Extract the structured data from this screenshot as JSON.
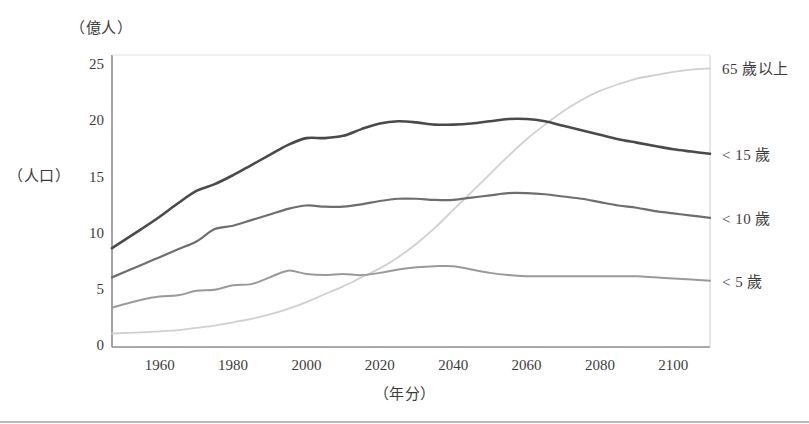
{
  "chart_data": {
    "type": "line",
    "title": "",
    "xlabel": "（年分）",
    "ylabel": "（人口）",
    "y_unit": "（億人）",
    "xlim": [
      1947,
      2110
    ],
    "ylim": [
      0,
      26
    ],
    "yticks": [
      0,
      5,
      10,
      15,
      20,
      25
    ],
    "xticks": [
      1960,
      1980,
      2000,
      2020,
      2040,
      2060,
      2080,
      2100
    ],
    "grid": false,
    "legend_position": "right-of-plot",
    "series": [
      {
        "name": "65 歲以上",
        "color": "#d0d0d0",
        "x": [
          1947,
          1955,
          1960,
          1965,
          1970,
          1975,
          1980,
          1985,
          1990,
          1995,
          2000,
          2005,
          2010,
          2015,
          2020,
          2025,
          2030,
          2035,
          2040,
          2045,
          2050,
          2055,
          2060,
          2065,
          2070,
          2075,
          2080,
          2085,
          2090,
          2095,
          2100,
          2105,
          2110
        ],
        "values": [
          1.2,
          1.3,
          1.4,
          1.5,
          1.7,
          1.9,
          2.2,
          2.5,
          2.9,
          3.4,
          4.0,
          4.7,
          5.4,
          6.2,
          7.0,
          8.0,
          9.2,
          10.6,
          12.2,
          13.8,
          15.4,
          17.0,
          18.5,
          19.8,
          21.0,
          22.0,
          22.8,
          23.4,
          23.9,
          24.2,
          24.5,
          24.7,
          24.8
        ]
      },
      {
        "name": "< 15 歲",
        "color": "#4a4a4a",
        "x": [
          1947,
          1955,
          1960,
          1965,
          1970,
          1975,
          1980,
          1985,
          1990,
          1995,
          2000,
          2005,
          2010,
          2015,
          2020,
          2025,
          2030,
          2035,
          2040,
          2045,
          2050,
          2055,
          2060,
          2065,
          2070,
          2075,
          2080,
          2085,
          2090,
          2095,
          2100,
          2105,
          2110
        ],
        "values": [
          8.8,
          10.5,
          11.6,
          12.8,
          13.9,
          14.5,
          15.3,
          16.2,
          17.1,
          18.0,
          18.6,
          18.6,
          18.8,
          19.4,
          19.9,
          20.1,
          20.0,
          19.8,
          19.8,
          19.9,
          20.1,
          20.3,
          20.3,
          20.1,
          19.7,
          19.3,
          18.9,
          18.5,
          18.2,
          17.9,
          17.6,
          17.4,
          17.2
        ]
      },
      {
        "name": "< 10 歲",
        "color": "#6e6e6e",
        "x": [
          1947,
          1955,
          1960,
          1965,
          1970,
          1975,
          1980,
          1985,
          1990,
          1995,
          2000,
          2005,
          2010,
          2015,
          2020,
          2025,
          2030,
          2035,
          2040,
          2045,
          2050,
          2055,
          2060,
          2065,
          2070,
          2075,
          2080,
          2085,
          2090,
          2095,
          2100,
          2105,
          2110
        ],
        "values": [
          6.2,
          7.3,
          8.0,
          8.7,
          9.4,
          10.5,
          10.8,
          11.3,
          11.8,
          12.3,
          12.6,
          12.5,
          12.5,
          12.7,
          13.0,
          13.2,
          13.2,
          13.1,
          13.1,
          13.3,
          13.5,
          13.7,
          13.7,
          13.6,
          13.4,
          13.2,
          12.9,
          12.6,
          12.4,
          12.1,
          11.9,
          11.7,
          11.5
        ]
      },
      {
        "name": "< 5 歲",
        "color": "#9a9a9a",
        "x": [
          1947,
          1955,
          1960,
          1965,
          1970,
          1975,
          1980,
          1985,
          1990,
          1995,
          2000,
          2005,
          2010,
          2015,
          2020,
          2025,
          2030,
          2035,
          2040,
          2045,
          2050,
          2055,
          2060,
          2065,
          2070,
          2075,
          2080,
          2085,
          2090,
          2095,
          2100,
          2105,
          2110
        ],
        "values": [
          3.5,
          4.2,
          4.5,
          4.6,
          5.0,
          5.1,
          5.5,
          5.6,
          6.2,
          6.8,
          6.5,
          6.4,
          6.5,
          6.4,
          6.6,
          6.9,
          7.1,
          7.2,
          7.2,
          6.9,
          6.6,
          6.4,
          6.3,
          6.3,
          6.3,
          6.3,
          6.3,
          6.3,
          6.3,
          6.2,
          6.1,
          6.0,
          5.9
        ]
      }
    ]
  },
  "plot": {
    "x_left_px": 112,
    "x_right_px": 710,
    "y_top_px": 55,
    "y_bottom_px": 347
  }
}
